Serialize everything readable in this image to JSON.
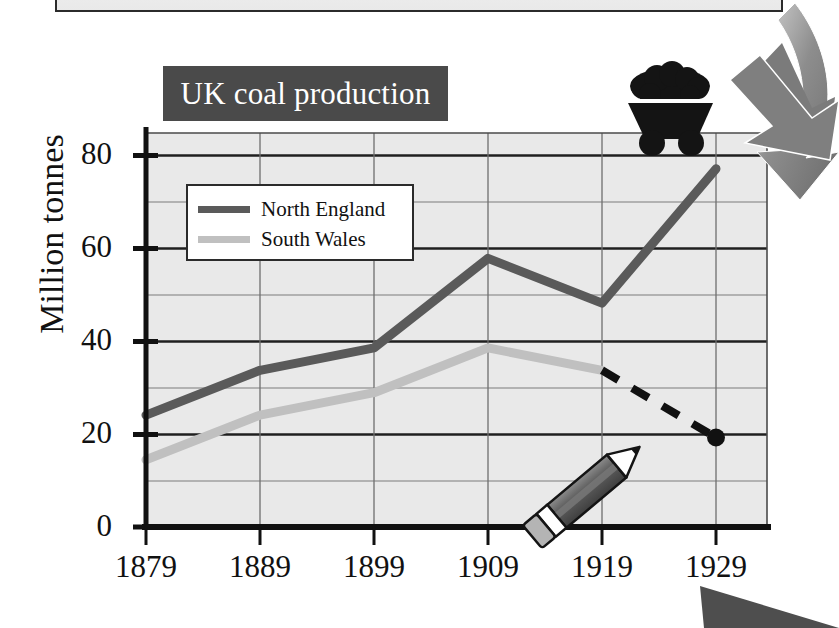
{
  "page": {
    "background_color": "#ffffff"
  },
  "top_panel": {
    "name": "partial-panel-above",
    "fill_color": "#eeeeee",
    "border_color": "#2b2b2b"
  },
  "title": {
    "text": "UK coal production",
    "banner_color": "#4a4a4a",
    "text_color": "#ffffff"
  },
  "axis": {
    "y_label": "Million tonnes",
    "y_ticks": [
      "0",
      "20",
      "40",
      "60",
      "80"
    ],
    "y_minor_gridlines": [
      10,
      30,
      50,
      70
    ],
    "x_ticks": [
      "1879",
      "1889",
      "1899",
      "1909",
      "1919",
      "1929"
    ]
  },
  "legend": {
    "position": "inside-top-left",
    "entries": [
      {
        "label": "North England",
        "color": "#5a5a5a"
      },
      {
        "label": "South Wales",
        "color": "#c0c0c0"
      }
    ]
  },
  "icons": {
    "coal_cart": "coal-cart-icon",
    "pencil": "pencil-icon",
    "arrow_top_right": "curved-arrow-down-left-icon",
    "arrow_bottom_right": "triangle-arrow-icon"
  },
  "annotation": {
    "projection_style": "dashed",
    "projection_color": "#111111",
    "endpoint_marker": "filled-circle",
    "endpoint_year": "1929",
    "endpoint_value": 20
  },
  "chart_data": {
    "type": "line",
    "title": "UK coal production",
    "xlabel": "",
    "ylabel": "Million tonnes",
    "x": [
      1879,
      1889,
      1899,
      1909,
      1919,
      1929
    ],
    "xlim": [
      1879,
      1933
    ],
    "ylim": [
      0,
      88
    ],
    "yticks": [
      0,
      20,
      40,
      60,
      80
    ],
    "grid": true,
    "legend_position": "upper left inside",
    "series": [
      {
        "name": "North England",
        "color": "#5a5a5a",
        "style": "solid",
        "values": [
          25,
          35,
          40,
          60,
          50,
          80
        ]
      },
      {
        "name": "South Wales",
        "color": "#c0c0c0",
        "style": "solid",
        "values": [
          15,
          25,
          30,
          40,
          35,
          null
        ]
      },
      {
        "name": "South Wales projection",
        "color": "#111111",
        "style": "dashed",
        "x": [
          1919,
          1929
        ],
        "values": [
          35,
          20
        ],
        "marker_at_end": true
      }
    ]
  }
}
